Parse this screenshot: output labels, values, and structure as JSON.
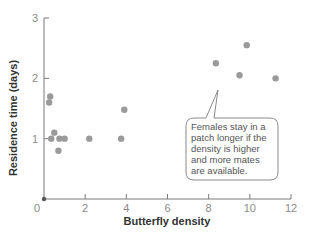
{
  "chart_data": {
    "type": "scatter",
    "title": "",
    "xlabel": "Butterfly density",
    "ylabel": "Residence time (days)",
    "xlim": [
      0,
      12
    ],
    "ylim": [
      0,
      3
    ],
    "x_ticks": [
      0,
      2,
      4,
      6,
      8,
      10,
      12
    ],
    "y_ticks": [
      1,
      2,
      3
    ],
    "x_tick_labels": [
      "0",
      "2",
      "4",
      "6",
      "8",
      "10",
      "12"
    ],
    "y_tick_labels": [
      "1",
      "2",
      "3"
    ],
    "grid": false,
    "legend": null,
    "point_color": "#9a9a9a",
    "series": [
      {
        "name": "observations",
        "points": [
          {
            "x": 0.0,
            "y": 0.0
          },
          {
            "x": 0.3,
            "y": 1.7
          },
          {
            "x": 0.25,
            "y": 1.6
          },
          {
            "x": 0.5,
            "y": 1.1
          },
          {
            "x": 0.35,
            "y": 1.0
          },
          {
            "x": 0.75,
            "y": 1.0
          },
          {
            "x": 1.0,
            "y": 1.0
          },
          {
            "x": 0.7,
            "y": 0.8
          },
          {
            "x": 2.2,
            "y": 1.0
          },
          {
            "x": 3.75,
            "y": 1.0
          },
          {
            "x": 3.9,
            "y": 1.48
          },
          {
            "x": 8.35,
            "y": 2.25
          },
          {
            "x": 9.85,
            "y": 2.55
          },
          {
            "x": 9.5,
            "y": 2.05
          },
          {
            "x": 11.25,
            "y": 2.0
          }
        ]
      }
    ],
    "annotations": [
      {
        "text_lines": [
          "Females stay in a",
          "patch longer if the",
          "density is higher",
          "and more mates",
          "are available."
        ],
        "points_to": {
          "x": 8.6,
          "y": 1.8
        }
      }
    ]
  }
}
